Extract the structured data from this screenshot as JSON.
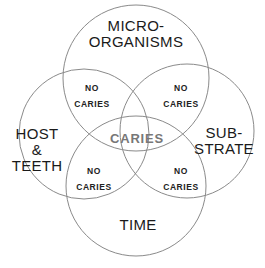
{
  "diagram": {
    "type": "venn",
    "circles": [
      {
        "id": "microorganisms",
        "label_line1": "MICRO-",
        "label_line2": "ORGANISMS"
      },
      {
        "id": "host",
        "label_line1": "HOST",
        "label_line2": "&",
        "label_line3": "TEETH"
      },
      {
        "id": "substrate",
        "label_line1": "SUB-",
        "label_line2": "STRATE"
      },
      {
        "id": "time",
        "label_line1": "TIME"
      }
    ],
    "intersections": [
      {
        "id": "micro-host",
        "line1": "NO",
        "line2": "CARIES"
      },
      {
        "id": "micro-substrate",
        "line1": "NO",
        "line2": "CARIES"
      },
      {
        "id": "host-time",
        "line1": "NO",
        "line2": "CARIES"
      },
      {
        "id": "substrate-time",
        "line1": "NO",
        "line2": "CARIES"
      }
    ],
    "center": {
      "label": "CARIES"
    },
    "colors": {
      "stroke": "#8a8a8a",
      "text": "#1a1a1a",
      "center_text": "#777777"
    }
  }
}
